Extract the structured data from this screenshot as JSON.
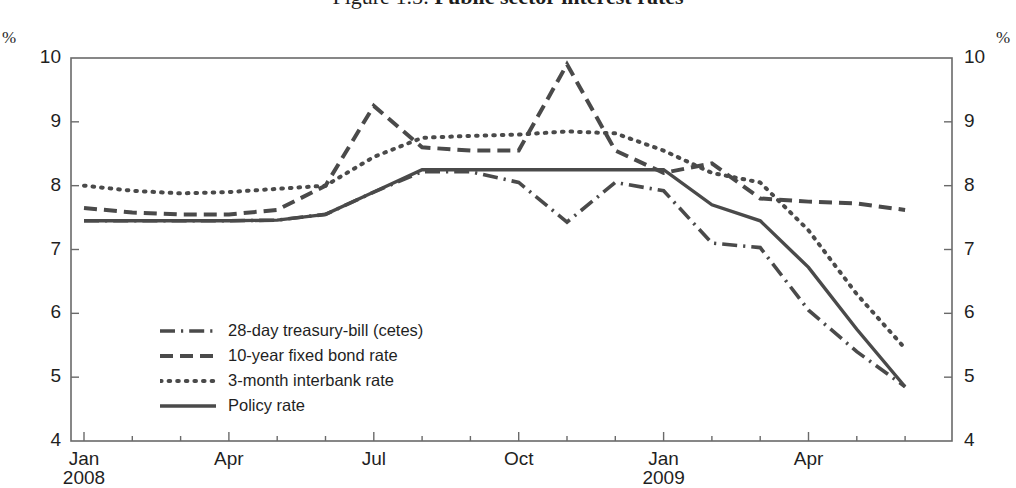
{
  "figure": {
    "number": "Figure 1.5:",
    "title": "Public sector interest rates",
    "unit_left": "%",
    "unit_right": "%"
  },
  "axes": {
    "y_left_label": "%",
    "y_right_label": "%",
    "y_ticks": [
      "10",
      "9",
      "8",
      "7",
      "6",
      "5",
      "4"
    ],
    "x_ticks": [
      {
        "label": "Jan",
        "sub": "2008"
      },
      {
        "label": "Apr",
        "sub": ""
      },
      {
        "label": "Jul",
        "sub": ""
      },
      {
        "label": "Oct",
        "sub": ""
      },
      {
        "label": "Jan",
        "sub": "2009"
      },
      {
        "label": "Apr",
        "sub": ""
      }
    ]
  },
  "legend": {
    "items": [
      {
        "label": "28-day treasury-bill (cetes)",
        "style": "dash-dot"
      },
      {
        "label": "10-year fixed bond rate",
        "style": "dashed"
      },
      {
        "label": "3-month interbank rate",
        "style": "dotted"
      },
      {
        "label": "Policy rate",
        "style": "solid"
      }
    ]
  },
  "chart_data": {
    "type": "line",
    "title": "Figure 1.5: Public sector interest rates",
    "xlabel": "",
    "ylabel": "%",
    "ylim": [
      4,
      10
    ],
    "grid": false,
    "legend_position": "inside-lower-left",
    "line_color": "#4a4a4a",
    "x": [
      "2008-01",
      "2008-02",
      "2008-03",
      "2008-04",
      "2008-05",
      "2008-06",
      "2008-07",
      "2008-08",
      "2008-09",
      "2008-10",
      "2008-11",
      "2008-12",
      "2009-01",
      "2009-02",
      "2009-03",
      "2009-04",
      "2009-05",
      "2009-06"
    ],
    "x_tick_labels": [
      "Jan 2008",
      "Apr",
      "Jul",
      "Oct",
      "Jan 2009",
      "Apr"
    ],
    "series": [
      {
        "name": "28-day treasury-bill (cetes)",
        "style": "dash-dot",
        "values": [
          7.45,
          7.45,
          7.45,
          7.45,
          7.46,
          7.55,
          7.9,
          8.22,
          8.22,
          8.05,
          7.43,
          8.05,
          7.92,
          7.1,
          7.03,
          6.05,
          5.4,
          4.85
        ]
      },
      {
        "name": "10-year fixed bond rate",
        "style": "dashed",
        "values": [
          7.65,
          7.58,
          7.55,
          7.55,
          7.62,
          8.0,
          9.25,
          8.6,
          8.55,
          8.55,
          9.9,
          8.55,
          8.2,
          8.35,
          7.8,
          7.75,
          7.72,
          7.62
        ]
      },
      {
        "name": "3-month interbank rate",
        "style": "dotted",
        "values": [
          8.0,
          7.92,
          7.88,
          7.9,
          7.95,
          8.0,
          8.45,
          8.75,
          8.78,
          8.8,
          8.85,
          8.82,
          8.55,
          8.2,
          8.05,
          7.3,
          6.3,
          5.45
        ]
      },
      {
        "name": "Policy rate",
        "style": "solid",
        "values": [
          7.45,
          7.45,
          7.45,
          7.45,
          7.46,
          7.55,
          7.9,
          8.25,
          8.25,
          8.25,
          8.25,
          8.25,
          8.25,
          7.7,
          7.45,
          6.72,
          5.75,
          4.85
        ]
      }
    ]
  }
}
